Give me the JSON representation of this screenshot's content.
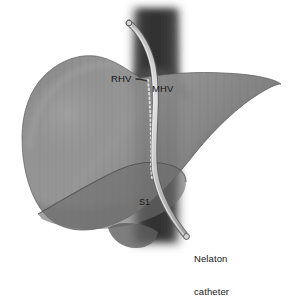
{
  "figure": {
    "background_color": "#ffffff",
    "width": 296,
    "height": 269
  },
  "colors": {
    "background": "#ffffff",
    "liver_body": "#848484",
    "liver_body_dark": "#6f6f6f",
    "liver_highlight": "#9a9a9a",
    "liver_outline": "#4a4a4a",
    "caudate_lobe": "#6a6a6a",
    "ivc_column": "#3b3b3b",
    "ivc_column_edge": "#5d5d5d",
    "catheter_fill": "#cfcfcf",
    "catheter_outline": "#6b6b6b",
    "dashed_line": "#d8d8d8",
    "label_text": "#161616"
  },
  "labels": {
    "rhv": "RHV",
    "mhv": "MHV",
    "s1": "S1",
    "nelaton_line1": "Nelaton",
    "nelaton_line2": "catheter"
  },
  "structures": [
    {
      "name": "liver",
      "label": "Liver parenchyma"
    },
    {
      "name": "right-hepatic-vein",
      "label": "RHV"
    },
    {
      "name": "middle-hepatic-vein",
      "label": "MHV"
    },
    {
      "name": "caudate-lobe",
      "label": "S1"
    },
    {
      "name": "inferior-vena-cava",
      "label": "IVC"
    },
    {
      "name": "nelaton-catheter",
      "label": "Nelaton catheter"
    }
  ]
}
